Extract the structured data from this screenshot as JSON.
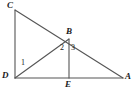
{
  "figure": {
    "type": "geometry-diagram",
    "canvas": {
      "width": 136,
      "height": 94,
      "background": "#ffffff"
    },
    "stroke_color": "#555555",
    "text_color": "#1a1a1a",
    "points": {
      "C": {
        "label": "C",
        "x": 15,
        "y": 10
      },
      "B": {
        "label": "B",
        "x": 69,
        "y": 39
      },
      "D": {
        "label": "D",
        "x": 15,
        "y": 78
      },
      "E": {
        "label": "E",
        "x": 69,
        "y": 78
      },
      "A": {
        "label": "A",
        "x": 123,
        "y": 78
      }
    },
    "segments": [
      {
        "name": "CD",
        "from": "C",
        "to": "D"
      },
      {
        "name": "CA",
        "from": "C",
        "to": "A"
      },
      {
        "name": "DA",
        "from": "D",
        "to": "A"
      },
      {
        "name": "DB",
        "from": "D",
        "to": "B"
      },
      {
        "name": "BE",
        "from": "B",
        "to": "E"
      }
    ],
    "angle_labels": [
      {
        "name": "angle-1",
        "label": "1",
        "at_vertex": "D",
        "x": 23,
        "y": 63
      },
      {
        "name": "angle-2",
        "label": "2",
        "at_vertex": "B",
        "x": 63,
        "y": 48
      },
      {
        "name": "angle-3",
        "label": "3",
        "at_vertex": "B",
        "x": 74,
        "y": 48
      }
    ]
  }
}
